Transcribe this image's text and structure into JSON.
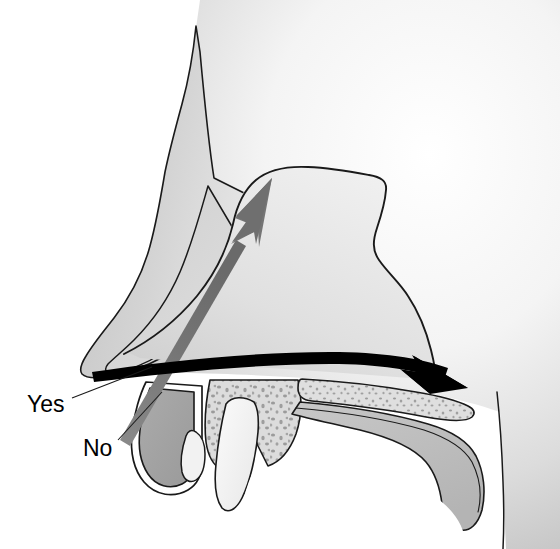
{
  "figure": {
    "background_color": "#ffffff",
    "width": 560,
    "height": 549
  },
  "labels": [
    {
      "id": "yes",
      "text": "Yes",
      "x": 27,
      "y": 412,
      "leader_from": [
        72,
        398
      ],
      "leader_to": [
        152,
        367
      ],
      "indicates": "correct-direction-black-arrow"
    },
    {
      "id": "no",
      "text": "No",
      "x": 83,
      "y": 456,
      "leader_from": [
        118,
        440
      ],
      "leader_to": [
        160,
        395
      ],
      "indicates": "incorrect-direction-gray-arrow"
    }
  ],
  "arrows": [
    {
      "id": "correct-arrow",
      "label": "Yes",
      "color": "#000000",
      "description": "Black curved arrow running posteriorly along the nasal floor toward the nasopharynx",
      "start": [
        93,
        369
      ],
      "end": [
        466,
        387
      ],
      "direction": "posterior-horizontal"
    },
    {
      "id": "incorrect-arrow",
      "label": "No",
      "color": "#707070",
      "description": "Gray straight arrow angled superiorly toward the cribriform plate",
      "start": [
        120,
        440
      ],
      "end": [
        272,
        178
      ],
      "direction": "superior-oblique"
    }
  ],
  "anatomy": {
    "regions": [
      {
        "id": "facial-soft-tissue",
        "name": "Facial soft tissue / cheek",
        "fill": "#d2d2d2"
      },
      {
        "id": "external-nose",
        "name": "External nose skin",
        "fill": "#c9c9c9"
      },
      {
        "id": "nasal-cartilage",
        "name": "Nasal alar cartilage",
        "fill": "#cccccc"
      },
      {
        "id": "nasal-airway",
        "name": "Nasal cavity airway",
        "fill": "#e2e2e2"
      },
      {
        "id": "upper-lip",
        "name": "Upper lip and gingiva",
        "fill": "#a6a6a6"
      },
      {
        "id": "maxilla-bone",
        "name": "Maxillary alveolar bone (cancellous)",
        "fill": "#d8d8d8"
      },
      {
        "id": "hard-palate",
        "name": "Hard palate bone",
        "fill": "#d8d8d8"
      },
      {
        "id": "soft-palate",
        "name": "Soft palate",
        "fill": "#c4c4c4"
      },
      {
        "id": "incisor-tooth",
        "name": "Maxillary central incisor",
        "fill": "#f4f4f4"
      },
      {
        "id": "oral-cavity",
        "name": "Oral cavity",
        "fill": "#ffffff"
      }
    ],
    "colors": {
      "outline": "#1a1a1a",
      "bone_speckle": "#888888",
      "shadow": "#bdbdbd",
      "highlight": "#f2f2f2"
    }
  }
}
